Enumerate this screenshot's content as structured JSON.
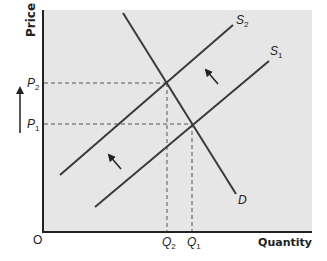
{
  "diagram": {
    "type": "supply-demand",
    "colors": {
      "background": "#ffffff",
      "plot_area": "#e6e6e6",
      "line": "#3a3a3a",
      "dashed": "#555555",
      "text": "#222222"
    },
    "axes": {
      "y_title": "Price",
      "x_title": "Quantity",
      "origin_label": "O"
    },
    "price_labels": {
      "p2": {
        "base": "P",
        "sub": "2"
      },
      "p1": {
        "base": "P",
        "sub": "1"
      }
    },
    "quantity_labels": {
      "q2": {
        "base": "Q",
        "sub": "2"
      },
      "q1": {
        "base": "Q",
        "sub": "1"
      }
    },
    "curves": {
      "s2": {
        "base": "S",
        "sub": "2"
      },
      "s1": {
        "base": "S",
        "sub": "1"
      },
      "d": {
        "label": "D"
      }
    },
    "annotations": {
      "price_rise_arrow": "up-arrow",
      "supply_shift_arrows": [
        "shift-left-up-arrow",
        "shift-left-up-arrow"
      ]
    }
  }
}
